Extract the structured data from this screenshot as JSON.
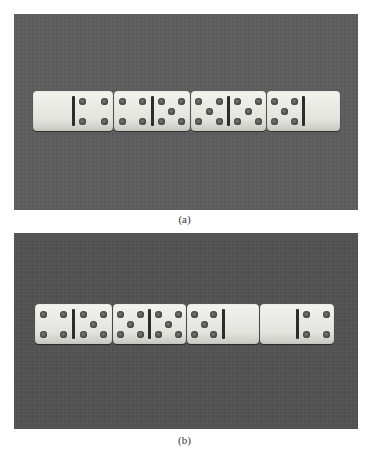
{
  "figure": {
    "panels": [
      {
        "id": "a",
        "caption": "(a)",
        "background_color": "#5f5f5f",
        "dominoes": [
          {
            "left": 0,
            "right": 4
          },
          {
            "left": 4,
            "right": 5
          },
          {
            "left": 5,
            "right": 5
          },
          {
            "left": 5,
            "right": 0
          }
        ]
      },
      {
        "id": "b",
        "caption": "(b)",
        "background_color": "#545454",
        "dominoes": [
          {
            "left": 4,
            "right": 5
          },
          {
            "left": 5,
            "right": 5
          },
          {
            "left": 5,
            "right": 0
          },
          {
            "left": 0,
            "right": 4
          }
        ]
      }
    ]
  }
}
